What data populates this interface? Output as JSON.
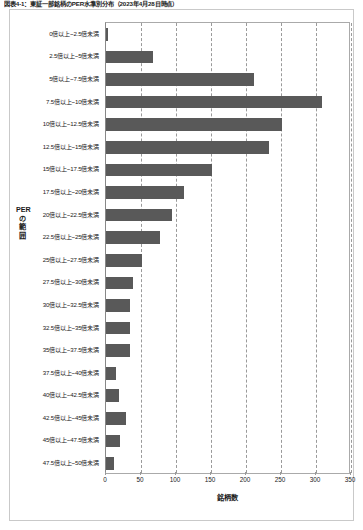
{
  "caption": "図表4-1：東証一部銘柄のPER水準別分布（2023年4月28日時点）",
  "chart_data": {
    "type": "bar",
    "orientation": "horizontal",
    "title": "図表4-1：東証一部銘柄のPER水準別分布（2023年4月28日時点）",
    "xlabel": "銘柄数",
    "ylabel": "PERの範囲",
    "xlim": [
      0,
      350
    ],
    "xticks": [
      0,
      50,
      100,
      150,
      200,
      250,
      300,
      350
    ],
    "grid": "vertical-dashed",
    "legend": "none",
    "bar_color": "#595959",
    "categories": [
      "0倍以上~2.5倍未満",
      "2.5倍以上~5倍未満",
      "5倍以上~7.5倍未満",
      "7.5倍以上~10倍未満",
      "10倍以上~12.5倍未満",
      "12.5倍以上~15倍未満",
      "15倍以上~17.5倍未満",
      "17.5倍以上~20倍未満",
      "20倍以上~22.5倍未満",
      "22.5倍以上~25倍未満",
      "25倍以上~27.5倍未満",
      "27.5倍以上~30倍未満",
      "30倍以上~32.5倍未満",
      "32.5倍以上~35倍未満",
      "35倍以上~37.5倍未満",
      "37.5倍以上~40倍未満",
      "40倍以上~42.5倍未満",
      "42.5倍以上~45倍未満",
      "45倍以上~47.5倍未満",
      "47.5倍以上~50倍未満"
    ],
    "values": [
      3,
      67,
      211,
      309,
      251,
      233,
      151,
      111,
      94,
      77,
      51,
      38,
      34,
      34,
      34,
      14,
      18,
      29,
      20,
      11
    ]
  }
}
